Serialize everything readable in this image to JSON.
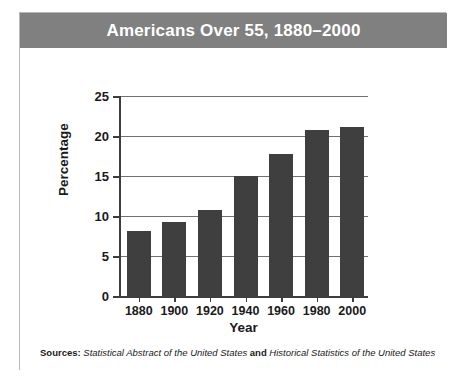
{
  "card": {
    "title": "Americans Over 55, 1880–2000",
    "title_bar_color": "#808080",
    "border_color": "#b8b8b8",
    "background": "#ffffff"
  },
  "sources": {
    "label": "Sources:",
    "first_title": "Statistical Abstract of the United States",
    "conjunction": "and",
    "second_title": "Historical Statistics of the United States"
  },
  "chart_data": {
    "type": "bar",
    "title": "Americans Over 55, 1880–2000",
    "xlabel": "Year",
    "ylabel": "Percentage",
    "categories": [
      "1880",
      "1900",
      "1920",
      "1940",
      "1960",
      "1980",
      "2000"
    ],
    "values": [
      8.1,
      9.3,
      10.7,
      15.0,
      17.8,
      20.8,
      21.1
    ],
    "ylim": [
      0,
      25
    ],
    "yticks": [
      0,
      5,
      10,
      15,
      20,
      25
    ],
    "ytick_labels": [
      "0",
      "5",
      "10",
      "15",
      "20",
      "25"
    ],
    "grid": true,
    "grid_color": "#707070",
    "bar_color": "#3f3f3f",
    "axis_color": "#3d3d3d",
    "legend": null
  }
}
